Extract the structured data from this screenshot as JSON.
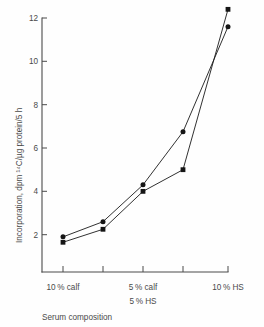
{
  "figure": {
    "background_color": "#fefefe",
    "ink_color": "#1a1a1a",
    "axis_color": "#4a4a4a"
  },
  "chart_data": {
    "type": "line",
    "title": "",
    "subtitle": "",
    "xlabel": "Serum composition",
    "ylabel": "Incorporation, dpm ¹⁴C/µg protein/5 h",
    "ylim": [
      0,
      12.8
    ],
    "ytick_labels": [
      "2",
      "4",
      "6",
      "8",
      "10",
      "12"
    ],
    "ytick_values": [
      2,
      4,
      6,
      8,
      10,
      12
    ],
    "grid": false,
    "legend_position": "none",
    "x": [
      1,
      2,
      3,
      4,
      5
    ],
    "xtick_count": 5,
    "category_labels": [
      {
        "line1": "10 % calf",
        "line2": "",
        "x_index": 1
      },
      {
        "line1": "5 % calf",
        "line2": "5 % HS",
        "x_index": 3
      },
      {
        "line1": "10 % HS",
        "line2": "",
        "x_index": 5
      }
    ],
    "series": [
      {
        "name": "circle-series",
        "marker": "circle",
        "values": [
          1.9,
          2.6,
          4.3,
          6.75,
          11.6
        ]
      },
      {
        "name": "square-series",
        "marker": "square",
        "values": [
          1.65,
          2.25,
          4.0,
          5.0,
          12.4
        ]
      }
    ],
    "annotations": []
  }
}
